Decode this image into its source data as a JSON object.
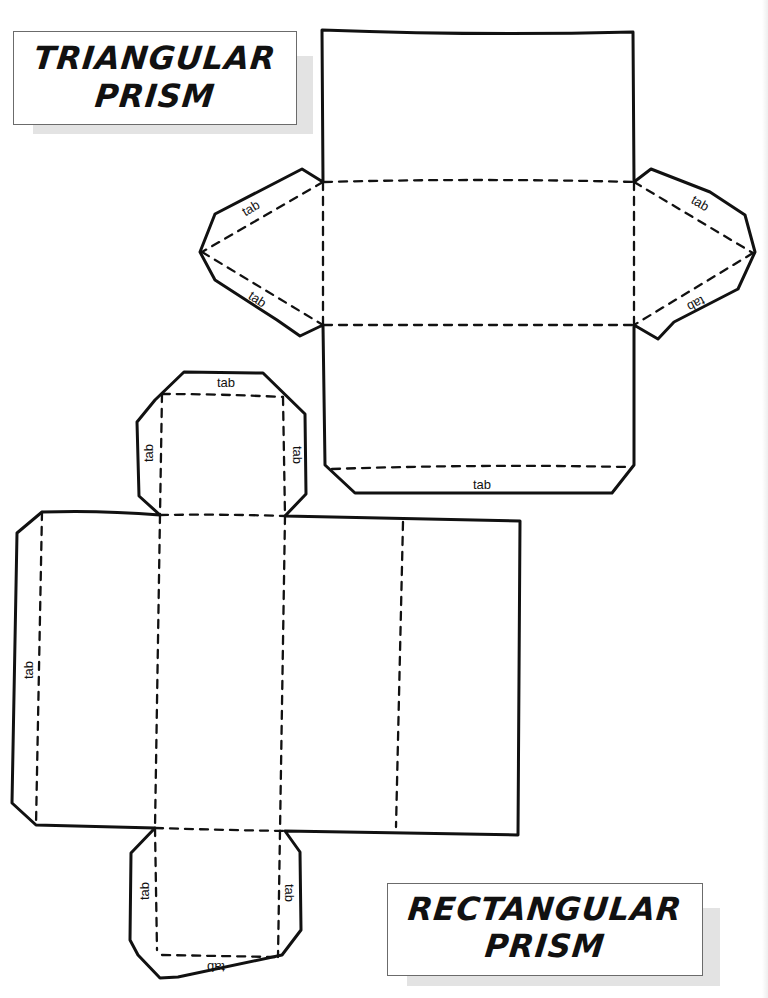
{
  "page": {
    "background": "#ffffff",
    "line_color": "#111111",
    "shadow_color": "#e3e3e3"
  },
  "titles": {
    "triangular": {
      "line1": "TRIANGULAR",
      "line2": "PRISM"
    },
    "rectangular": {
      "line1": "RECTANGULAR",
      "line2": "PRISM"
    }
  },
  "triangular_net": {
    "tabs": [
      {
        "label": "tab",
        "position": "left-upper"
      },
      {
        "label": "tab",
        "position": "left-lower"
      },
      {
        "label": "tab",
        "position": "right-upper"
      },
      {
        "label": "tab",
        "position": "right-lower"
      },
      {
        "label": "tab",
        "position": "bottom"
      }
    ]
  },
  "rectangular_net": {
    "tabs": [
      {
        "label": "tab",
        "position": "top-cap-top"
      },
      {
        "label": "tab",
        "position": "top-cap-left"
      },
      {
        "label": "tab",
        "position": "top-cap-right"
      },
      {
        "label": "tab",
        "position": "left-side"
      },
      {
        "label": "tab",
        "position": "bottom-cap-left"
      },
      {
        "label": "tab",
        "position": "bottom-cap-right"
      },
      {
        "label": "tab",
        "position": "bottom-cap-bottom"
      }
    ]
  }
}
